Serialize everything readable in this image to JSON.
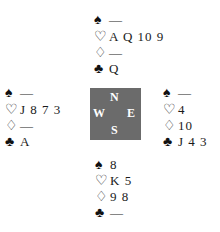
{
  "hands": {
    "north": {
      "spades": "—",
      "hearts": "A Q 10 9",
      "diamonds": "—",
      "clubs": "Q"
    },
    "west": {
      "spades": "—",
      "hearts": "J 8 7 3",
      "diamonds": "—",
      "clubs": "A"
    },
    "east": {
      "spades": "—",
      "hearts": "4",
      "diamonds": "10",
      "clubs": "J 4 3"
    },
    "south": {
      "spades": "8",
      "hearts": "K 5",
      "diamonds": "9 8",
      "clubs": "—"
    }
  },
  "suits": {
    "spades": "♠",
    "hearts": "♡",
    "diamonds": "♢",
    "clubs": "♣"
  },
  "compass": {
    "n": "N",
    "e": "E",
    "s": "S",
    "w": "W",
    "color": "#6b6b6b"
  }
}
